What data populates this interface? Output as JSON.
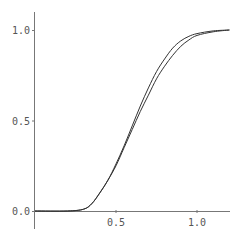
{
  "chart_data": {
    "type": "line",
    "title": "",
    "xlabel": "",
    "ylabel": "",
    "xlim": [
      0,
      1.2
    ],
    "ylim": [
      0,
      1.0
    ],
    "grid": false,
    "legend": null,
    "x_ticks": [
      "0.5",
      "1.0"
    ],
    "y_ticks": [
      "0.0",
      "0.5",
      "1.0"
    ],
    "x": [
      0.0,
      0.2,
      0.3,
      0.35,
      0.4,
      0.45,
      0.5,
      0.55,
      0.6,
      0.65,
      0.7,
      0.75,
      0.8,
      0.85,
      0.9,
      0.95,
      1.0,
      1.1,
      1.2
    ],
    "series": [
      {
        "name": "curve 1",
        "values": [
          0.0,
          0.0,
          0.01,
          0.04,
          0.1,
          0.17,
          0.26,
          0.36,
          0.47,
          0.58,
          0.68,
          0.77,
          0.84,
          0.9,
          0.94,
          0.965,
          0.98,
          0.995,
          1.0
        ]
      },
      {
        "name": "curve 2",
        "values": [
          0.0,
          0.0,
          0.01,
          0.04,
          0.1,
          0.17,
          0.25,
          0.35,
          0.45,
          0.55,
          0.64,
          0.73,
          0.8,
          0.86,
          0.91,
          0.945,
          0.97,
          0.99,
          1.0
        ]
      }
    ]
  }
}
